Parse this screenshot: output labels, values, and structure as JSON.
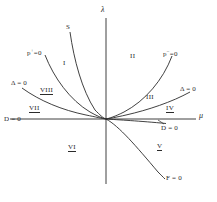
{
  "figure": {
    "kind": "bifurcation-diagram",
    "background": "#ffffff",
    "stroke_color": "#2b2b2b"
  },
  "axes": {
    "vertical": {
      "label": "λ",
      "name": "lambda-axis"
    },
    "horizontal": {
      "label": "μ",
      "name": "mu-axis"
    },
    "origin": {
      "x": 106,
      "y": 119
    }
  },
  "curves": [
    {
      "id": "S",
      "label": "S"
    },
    {
      "id": "p_plus",
      "label_base": "p",
      "label_sup": "+",
      "label_tail": "=0"
    },
    {
      "id": "p_minus",
      "label_base": "p",
      "label_sup": "−",
      "label_tail": "=0"
    },
    {
      "id": "delta_left",
      "label": "Δ = 0"
    },
    {
      "id": "delta_right",
      "label": "Δ = 0"
    },
    {
      "id": "D_left",
      "label": "D = 0"
    },
    {
      "id": "D_right",
      "label": "D = 0"
    },
    {
      "id": "F",
      "label": "F = 0"
    }
  ],
  "curve_labels": {
    "S": "S",
    "p_plus_base": "p",
    "p_plus_sup": "+",
    "p_plus_tail": "=0",
    "p_minus_base": "p",
    "p_minus_sup": "−",
    "p_minus_tail": "=0",
    "delta_left": "Δ = 0",
    "delta_right": "Δ = 0",
    "D_left": "D = 0",
    "D_right": "D = 0",
    "F_zero": "F = 0"
  },
  "regions": [
    {
      "id": "I",
      "label": "I",
      "underline": false
    },
    {
      "id": "II",
      "label": "II",
      "underline": false
    },
    {
      "id": "III",
      "label": "III",
      "underline": false
    },
    {
      "id": "IV",
      "label": "IV",
      "underline": true
    },
    {
      "id": "V",
      "label": "V",
      "underline": true
    },
    {
      "id": "VI",
      "label": "VI",
      "underline": true
    },
    {
      "id": "VII",
      "label": "VII",
      "underline": true
    },
    {
      "id": "VIII",
      "label": "VIII",
      "underline": true
    }
  ],
  "region_labels": {
    "I": "I",
    "II": "II",
    "III": "III",
    "IV": "IV",
    "V": "V",
    "VI": "VI",
    "VII": "VII",
    "VIII": "VIII"
  }
}
